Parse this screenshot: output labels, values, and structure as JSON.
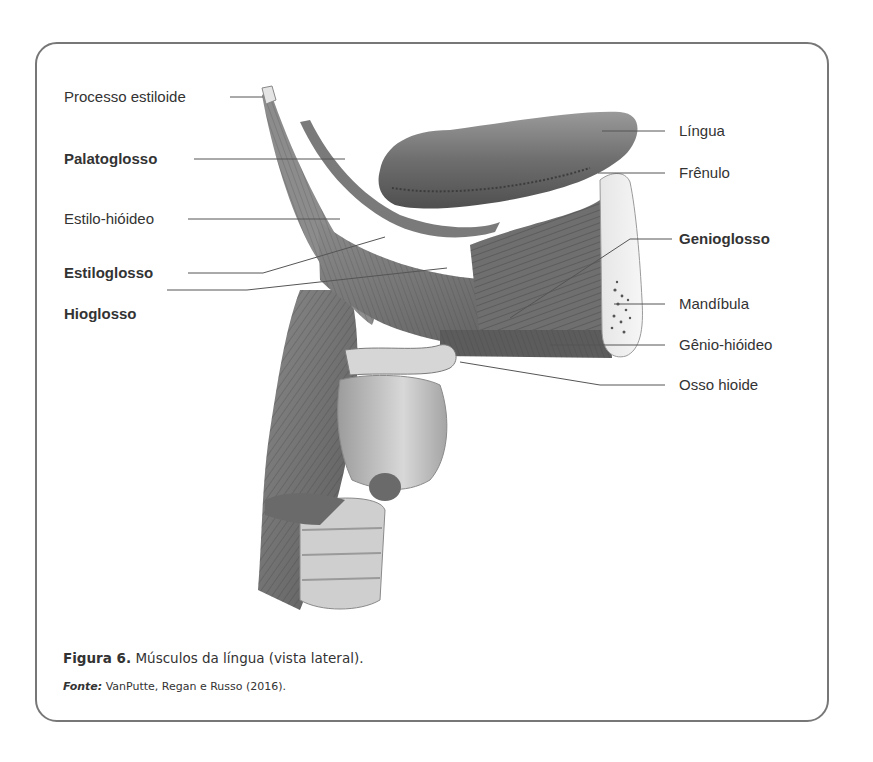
{
  "figure": {
    "labels_left": [
      {
        "text": "Processo estiloide",
        "bold": false
      },
      {
        "text": "Palatoglosso",
        "bold": true
      },
      {
        "text": "Estilo-hióideo",
        "bold": false
      },
      {
        "text": "Estiloglosso",
        "bold": true
      },
      {
        "text": "Hioglosso",
        "bold": true
      }
    ],
    "labels_right": [
      {
        "text": "Língua",
        "bold": false
      },
      {
        "text": "Frênulo",
        "bold": false
      },
      {
        "text": "Genioglosso",
        "bold": true
      },
      {
        "text": "Mandíbula",
        "bold": false
      },
      {
        "text": "Gênio-hióideo",
        "bold": false
      },
      {
        "text": "Osso hioide",
        "bold": false
      }
    ]
  },
  "caption": {
    "number": "Figura 6.",
    "text": "Músculos da língua (vista lateral)."
  },
  "source": {
    "label": "Fonte:",
    "text": "VanPutte, Regan e Russo (2016)."
  },
  "colors": {
    "frame": "#777777",
    "text": "#333333",
    "leader": "#555555"
  }
}
